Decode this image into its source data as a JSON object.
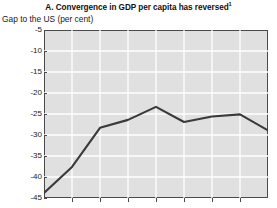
{
  "chart_data": {
    "type": "line",
    "title": "A. Convergence in GDP per capita has reversed",
    "title_footnote_marker": "1",
    "subtitle": "Gap to the US (per cent)",
    "ylabel": "Gap to the US (per cent)",
    "xlabel": "",
    "ylim": [
      -45,
      -5
    ],
    "ytick_labels": [
      "-5",
      "-10",
      "-15",
      "-20",
      "-25",
      "-30",
      "-35",
      "-40",
      "-45"
    ],
    "ytick_values": [
      -5,
      -10,
      -15,
      -20,
      -25,
      -30,
      -35,
      -40,
      -45
    ],
    "xtick_labels": [
      "",
      "",
      "",
      "",
      "",
      "",
      "",
      ""
    ],
    "grid": true,
    "grid_color": "#ffffff",
    "plot_background": "#e0e0e0",
    "line_color": "#3a3a3a",
    "legend": [],
    "x": [
      0,
      1,
      2,
      3,
      4,
      5,
      6,
      7,
      8
    ],
    "values": [
      -43.8,
      -37.6,
      -28.3,
      -26.4,
      -23.3,
      -26.9,
      -25.6,
      -25.1,
      -28.9
    ],
    "series": [
      {
        "name": "Gap to the US (per cent)",
        "values": [
          -43.8,
          -37.6,
          -28.3,
          -26.4,
          -23.3,
          -26.9,
          -25.6,
          -25.1,
          -28.9
        ]
      }
    ]
  }
}
